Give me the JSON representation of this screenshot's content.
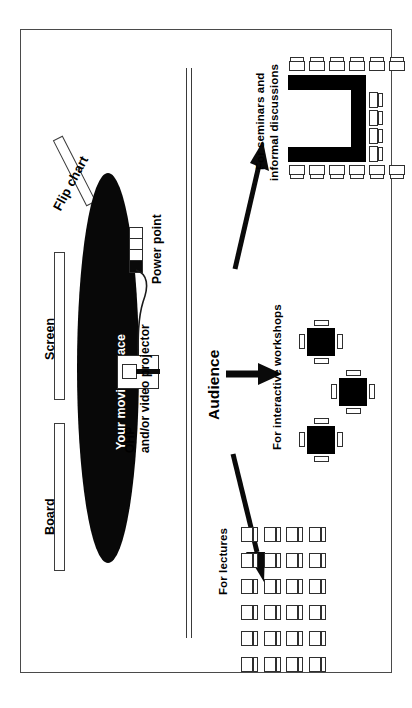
{
  "diagram": {
    "orientation": "labels rotated 90 degrees counter-clockwise",
    "frame": {
      "stroke": "#4a4a4a",
      "background": "#ffffff"
    }
  },
  "presenter_zone": {
    "labels": {
      "board": "Board",
      "screen": "Screen",
      "flip_chart": "Flip chart",
      "moving_space": "Your moving space",
      "power_point": "Power point",
      "projector": "OHP\nand/or video projector",
      "projector_line1": "OHP",
      "projector_line2": "and/or video projector"
    },
    "moving_space_color": "#080808",
    "power_outlet": {
      "cells": 4,
      "filled_index": 4
    }
  },
  "audience_zone": {
    "heading": "Audience",
    "sections": [
      {
        "id": "seminars",
        "label": "For seminars and\ninformal discussions",
        "label_line1": "For seminars and",
        "label_line2": "informal discussions",
        "layout": "u-shaped-table",
        "chairs_top": 6,
        "chairs_bottom": 6,
        "chairs_end": 4,
        "table_color": "#000000"
      },
      {
        "id": "workshops",
        "label": "For interactive workshops",
        "layout": "square-tables",
        "tables": 3,
        "chairs_per_table": 4,
        "table_color": "#000000"
      },
      {
        "id": "lectures",
        "label": "For lectures",
        "layout": "theatre-rows",
        "rows": 4,
        "seats_per_row": 6,
        "total_seats": 24
      }
    ],
    "arrows": [
      {
        "to": "seminars",
        "direction": "up-right"
      },
      {
        "to": "workshops",
        "direction": "right"
      },
      {
        "to": "lectures",
        "direction": "down-right"
      }
    ]
  }
}
